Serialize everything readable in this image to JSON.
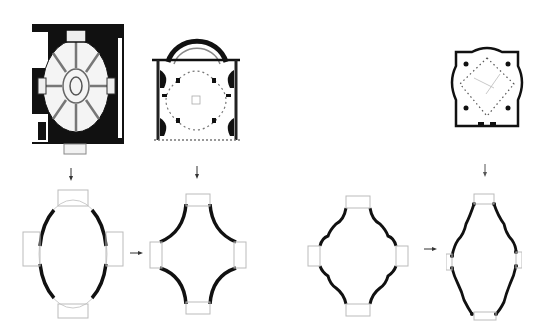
{
  "diagram": {
    "type": "architectural-plan-derivation",
    "background": "#ffffff",
    "ink_color": "#111111",
    "faint_color": "#9a9a9a",
    "top_row": [
      {
        "id": "plan-oval-church",
        "description": "rectangular building with oval domed nave, eight radial ribs, central oval"
      },
      {
        "id": "plan-quatrefoil-church",
        "description": "rectangular plan with curved apse at top and four-lobed interior"
      },
      {
        "id": "plan-octagonal-church",
        "description": "lobed square plan with dotted diagonal interior"
      }
    ],
    "bottom_row": [
      {
        "id": "schema-oval",
        "description": "oval with four rectangular chapels on axes"
      },
      {
        "id": "schema-cross-curved",
        "description": "cross shape with concave curved walls"
      },
      {
        "id": "schema-lobed-diamond",
        "description": "diamond with undulating walls and four chapels"
      },
      {
        "id": "schema-elongated-lobed",
        "description": "elongated lozenge with undulating walls"
      }
    ],
    "arrows": [
      {
        "from": "plan-oval-church",
        "to": "schema-oval",
        "direction": "down"
      },
      {
        "from": "plan-quatrefoil-church",
        "to": "schema-cross-curved",
        "direction": "down"
      },
      {
        "from": "plan-octagonal-church",
        "to": "schema-elongated-lobed",
        "direction": "down"
      },
      {
        "from": "schema-oval",
        "to": "schema-cross-curved",
        "direction": "right"
      },
      {
        "from": "schema-lobed-diamond",
        "to": "schema-elongated-lobed",
        "direction": "right"
      }
    ]
  }
}
